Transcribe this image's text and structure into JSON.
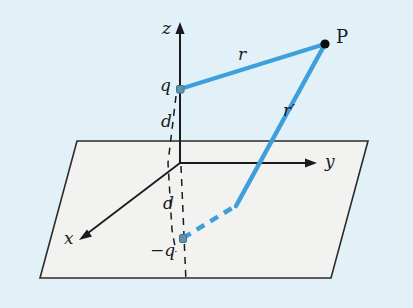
{
  "figure": {
    "kind": "physics-diagram",
    "colors": {
      "background": "#e2f1f8",
      "plane_fill": "#f2f2f0",
      "plane_stroke": "#2b2b2b",
      "axis_stroke": "#1b1b1b",
      "ray_blue": "#3f9fdc",
      "charge_dot": "#5a8ea8",
      "point_dot": "#0d0d0d"
    },
    "axes": [
      {
        "id": "z",
        "label": "z",
        "label_x": 162,
        "label_y": 20,
        "from": [
          180,
          278
        ],
        "to": [
          180,
          26
        ]
      },
      {
        "id": "y",
        "label": "y",
        "label_x": 325,
        "label_y": 154,
        "from": [
          180,
          163
        ],
        "to": [
          314,
          163
        ]
      },
      {
        "id": "x",
        "label": "x",
        "label_x": 64,
        "label_y": 231,
        "from": [
          180,
          163
        ],
        "to": [
          82,
          237
        ]
      }
    ],
    "points": [
      {
        "id": "q",
        "label": "q",
        "label_x": 160,
        "label_y": 77,
        "x": 180,
        "y": 89,
        "type": "charge-positive"
      },
      {
        "id": "image-q",
        "label": "−q",
        "label_x": 152,
        "label_y": 243,
        "x": 183,
        "y": 238,
        "type": "charge-negative"
      },
      {
        "id": "P",
        "label": "P",
        "label_x": 336,
        "label_y": 29,
        "x": 325,
        "y": 44,
        "type": "field-point"
      }
    ],
    "distance_labels": [
      {
        "id": "d-upper",
        "label": "d",
        "label_x": 161,
        "label_y": 114
      },
      {
        "id": "d-lower",
        "label": "d",
        "label_x": 163,
        "label_y": 196
      }
    ],
    "rays": [
      {
        "id": "r",
        "label": "r",
        "label_x": 238,
        "label_y": 47,
        "from": [
          180,
          89
        ],
        "to": [
          325,
          44
        ],
        "style": "solid"
      },
      {
        "id": "r-prime",
        "label": "r′",
        "label_x": 283,
        "label_y": 103,
        "from": [
          183,
          238
        ],
        "to": [
          325,
          44
        ],
        "style": "solid-above-plane-dashed-below"
      }
    ],
    "plane": {
      "id": "conducting-plane",
      "corners": [
        [
          77,
          141
        ],
        [
          368,
          141
        ],
        [
          331,
          278
        ],
        [
          40,
          278
        ]
      ]
    }
  }
}
